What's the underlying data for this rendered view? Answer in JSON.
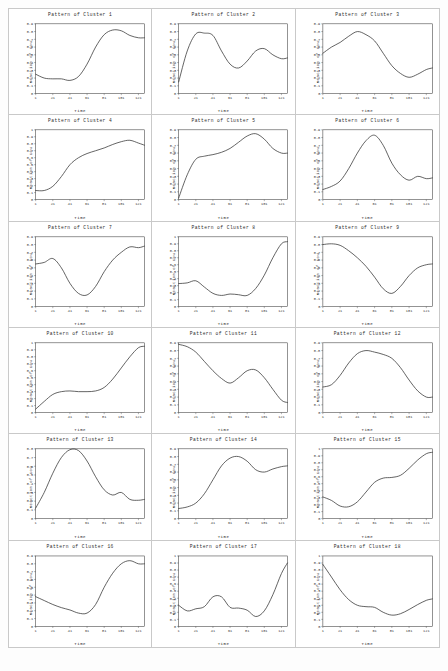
{
  "figure": {
    "caption": "",
    "columns": 3,
    "rows": 6
  },
  "chart_data": [
    {
      "type": "line",
      "title": "Pattern of Cluster 1",
      "xlabel": "Time",
      "ylabel": "Reaction of Cow",
      "xticks": [
        1,
        21,
        41,
        61,
        81,
        101,
        121
      ],
      "yticks": [
        0,
        0.1,
        0.2,
        0.3,
        0.4,
        0.5,
        0.6,
        0.7,
        0.8,
        0.9
      ],
      "xlim": [
        1,
        128
      ],
      "ylim": [
        0,
        0.9
      ],
      "grid": false,
      "legend": "none",
      "x": [
        1,
        11,
        21,
        31,
        41,
        51,
        61,
        71,
        81,
        91,
        101,
        111,
        121,
        128
      ],
      "values": [
        0.25,
        0.2,
        0.19,
        0.19,
        0.17,
        0.22,
        0.38,
        0.6,
        0.76,
        0.82,
        0.81,
        0.75,
        0.72,
        0.72
      ]
    },
    {
      "type": "line",
      "title": "Pattern of Cluster 2",
      "xlabel": "Time",
      "ylabel": "Reaction of Cow",
      "xticks": [
        1,
        21,
        41,
        61,
        81,
        101,
        121
      ],
      "yticks": [
        0,
        0.1,
        0.2,
        0.3,
        0.4,
        0.5,
        0.6,
        0.7,
        0.8,
        0.9
      ],
      "xlim": [
        1,
        128
      ],
      "ylim": [
        0,
        0.9
      ],
      "grid": false,
      "legend": "none",
      "x": [
        1,
        11,
        21,
        31,
        41,
        51,
        61,
        71,
        81,
        91,
        101,
        111,
        121,
        128
      ],
      "values": [
        0.15,
        0.55,
        0.77,
        0.78,
        0.75,
        0.55,
        0.38,
        0.33,
        0.42,
        0.55,
        0.58,
        0.5,
        0.45,
        0.46
      ]
    },
    {
      "type": "line",
      "title": "Pattern of Cluster 3",
      "xlabel": "Time",
      "ylabel": "Reaction of Cow",
      "xticks": [
        1,
        21,
        41,
        61,
        81,
        101,
        121
      ],
      "yticks": [
        0,
        0.1,
        0.2,
        0.3,
        0.4,
        0.5,
        0.6,
        0.7,
        0.8,
        0.9
      ],
      "xlim": [
        1,
        128
      ],
      "ylim": [
        0,
        0.9
      ],
      "grid": false,
      "legend": "none",
      "x": [
        1,
        11,
        21,
        31,
        41,
        51,
        61,
        71,
        81,
        91,
        101,
        111,
        121,
        128
      ],
      "values": [
        0.52,
        0.6,
        0.66,
        0.74,
        0.8,
        0.76,
        0.68,
        0.52,
        0.36,
        0.26,
        0.21,
        0.25,
        0.31,
        0.33
      ]
    },
    {
      "type": "line",
      "title": "Pattern of Cluster 4",
      "xlabel": "Time",
      "ylabel": "Reaction of Cow",
      "xticks": [
        1,
        21,
        41,
        61,
        81,
        101,
        121
      ],
      "yticks": [
        0,
        0.1,
        0.2,
        0.3,
        0.4,
        0.5,
        0.6,
        0.7,
        0.8,
        0.9,
        1
      ],
      "xlim": [
        1,
        128
      ],
      "ylim": [
        0,
        1
      ],
      "grid": false,
      "legend": "none",
      "x": [
        1,
        11,
        21,
        31,
        41,
        51,
        61,
        71,
        81,
        91,
        101,
        111,
        121,
        128
      ],
      "values": [
        0.13,
        0.13,
        0.19,
        0.33,
        0.5,
        0.6,
        0.66,
        0.7,
        0.74,
        0.79,
        0.83,
        0.85,
        0.81,
        0.78
      ]
    },
    {
      "type": "line",
      "title": "Pattern of Cluster 5",
      "xlabel": "Time",
      "ylabel": "Reaction of Cow",
      "xticks": [
        1,
        21,
        41,
        61,
        81,
        101,
        121
      ],
      "yticks": [
        0,
        0.1,
        0.2,
        0.3,
        0.4,
        0.5,
        0.6,
        0.7,
        0.8,
        0.9
      ],
      "xlim": [
        1,
        128
      ],
      "ylim": [
        0,
        0.9
      ],
      "grid": false,
      "legend": "none",
      "x": [
        1,
        11,
        21,
        31,
        41,
        51,
        61,
        71,
        81,
        91,
        101,
        111,
        121,
        128
      ],
      "values": [
        0.02,
        0.32,
        0.52,
        0.56,
        0.58,
        0.61,
        0.66,
        0.74,
        0.82,
        0.85,
        0.78,
        0.66,
        0.6,
        0.6
      ]
    },
    {
      "type": "line",
      "title": "Pattern of Cluster 6",
      "xlabel": "Time",
      "ylabel": "Reaction of Cow",
      "xticks": [
        1,
        21,
        41,
        61,
        81,
        101,
        121
      ],
      "yticks": [
        0,
        0.1,
        0.2,
        0.3,
        0.4,
        0.5,
        0.6,
        0.7,
        0.8,
        0.9
      ],
      "xlim": [
        1,
        128
      ],
      "ylim": [
        0,
        0.9
      ],
      "grid": false,
      "legend": "none",
      "x": [
        1,
        11,
        21,
        31,
        41,
        51,
        61,
        71,
        81,
        91,
        101,
        111,
        121,
        128
      ],
      "values": [
        0.13,
        0.17,
        0.24,
        0.4,
        0.6,
        0.76,
        0.83,
        0.7,
        0.47,
        0.32,
        0.25,
        0.3,
        0.27,
        0.28
      ]
    },
    {
      "type": "line",
      "title": "Pattern of Cluster 7",
      "xlabel": "Time",
      "ylabel": "Reaction of Cow",
      "xticks": [
        1,
        21,
        41,
        61,
        81,
        101,
        121
      ],
      "yticks": [
        0,
        0.1,
        0.2,
        0.3,
        0.4,
        0.5,
        0.6,
        0.7,
        0.8,
        0.9
      ],
      "xlim": [
        1,
        128
      ],
      "ylim": [
        0,
        0.9
      ],
      "grid": false,
      "legend": "none",
      "x": [
        1,
        11,
        21,
        31,
        41,
        51,
        61,
        71,
        81,
        91,
        101,
        111,
        121,
        128
      ],
      "values": [
        0.55,
        0.57,
        0.62,
        0.5,
        0.3,
        0.17,
        0.15,
        0.26,
        0.45,
        0.6,
        0.7,
        0.77,
        0.76,
        0.78
      ]
    },
    {
      "type": "line",
      "title": "Pattern of Cluster 8",
      "xlabel": "Time",
      "ylabel": "Reaction of Cow",
      "xticks": [
        1,
        21,
        41,
        61,
        81,
        101,
        121
      ],
      "yticks": [
        0,
        0.1,
        0.2,
        0.3,
        0.4,
        0.5,
        0.6,
        0.7,
        0.8,
        0.9,
        1
      ],
      "xlim": [
        1,
        128
      ],
      "ylim": [
        0,
        1
      ],
      "grid": false,
      "legend": "none",
      "x": [
        1,
        11,
        21,
        31,
        41,
        51,
        61,
        71,
        81,
        91,
        101,
        111,
        121,
        128
      ],
      "values": [
        0.33,
        0.34,
        0.37,
        0.28,
        0.19,
        0.16,
        0.18,
        0.17,
        0.16,
        0.26,
        0.45,
        0.7,
        0.9,
        0.93
      ]
    },
    {
      "type": "line",
      "title": "Pattern of Cluster 9",
      "xlabel": "Time",
      "ylabel": "Reaction of Cow",
      "xticks": [
        1,
        21,
        41,
        61,
        81,
        101,
        121
      ],
      "yticks": [
        0,
        0.1,
        0.2,
        0.3,
        0.4,
        0.5,
        0.6,
        0.7,
        0.8,
        0.9
      ],
      "xlim": [
        1,
        128
      ],
      "ylim": [
        0,
        0.9
      ],
      "grid": false,
      "legend": "none",
      "x": [
        1,
        11,
        21,
        31,
        41,
        51,
        61,
        71,
        81,
        91,
        101,
        111,
        121,
        128
      ],
      "values": [
        0.8,
        0.81,
        0.79,
        0.72,
        0.63,
        0.52,
        0.38,
        0.23,
        0.17,
        0.26,
        0.4,
        0.5,
        0.54,
        0.55
      ]
    },
    {
      "type": "line",
      "title": "Pattern of Cluster 10",
      "xlabel": "Time",
      "ylabel": "Reaction of Cow",
      "xticks": [
        1,
        21,
        41,
        61,
        81,
        101,
        121
      ],
      "yticks": [
        0,
        0.1,
        0.2,
        0.3,
        0.4,
        0.5,
        0.6,
        0.7,
        0.8,
        0.9,
        1
      ],
      "xlim": [
        1,
        128
      ],
      "ylim": [
        0,
        1
      ],
      "grid": false,
      "legend": "none",
      "x": [
        1,
        11,
        21,
        31,
        41,
        51,
        61,
        71,
        81,
        91,
        101,
        111,
        121,
        128
      ],
      "values": [
        0.05,
        0.16,
        0.26,
        0.3,
        0.31,
        0.3,
        0.3,
        0.31,
        0.36,
        0.48,
        0.64,
        0.8,
        0.93,
        0.95
      ]
    },
    {
      "type": "line",
      "title": "Pattern of Cluster 11",
      "xlabel": "Time",
      "ylabel": "Reaction of Cow",
      "xticks": [
        1,
        21,
        41,
        61,
        81,
        101,
        121
      ],
      "yticks": [
        0,
        0.1,
        0.2,
        0.3,
        0.4,
        0.5,
        0.6,
        0.7,
        0.8,
        0.9
      ],
      "xlim": [
        1,
        128
      ],
      "ylim": [
        0,
        0.9
      ],
      "grid": false,
      "legend": "none",
      "x": [
        1,
        11,
        21,
        31,
        41,
        51,
        61,
        71,
        81,
        91,
        101,
        111,
        121,
        128
      ],
      "values": [
        0.88,
        0.85,
        0.78,
        0.66,
        0.54,
        0.44,
        0.38,
        0.45,
        0.54,
        0.55,
        0.45,
        0.3,
        0.16,
        0.13
      ]
    },
    {
      "type": "line",
      "title": "Pattern of Cluster 12",
      "xlabel": "Time",
      "ylabel": "Reaction of Cow",
      "xticks": [
        1,
        21,
        41,
        61,
        81,
        101,
        121
      ],
      "yticks": [
        0,
        0.1,
        0.2,
        0.3,
        0.4,
        0.5,
        0.6,
        0.7,
        0.8,
        0.9
      ],
      "xlim": [
        1,
        128
      ],
      "ylim": [
        0,
        0.9
      ],
      "grid": false,
      "legend": "none",
      "x": [
        1,
        11,
        21,
        31,
        41,
        51,
        61,
        71,
        81,
        91,
        101,
        111,
        121,
        128
      ],
      "values": [
        0.33,
        0.36,
        0.48,
        0.64,
        0.76,
        0.8,
        0.78,
        0.75,
        0.7,
        0.58,
        0.42,
        0.28,
        0.2,
        0.2
      ]
    },
    {
      "type": "line",
      "title": "Pattern of Cluster 13",
      "xlabel": "Time",
      "ylabel": "Reaction of Cow",
      "xticks": [
        1,
        21,
        41,
        61,
        81,
        101,
        121
      ],
      "yticks": [
        0,
        0.1,
        0.2,
        0.3,
        0.4,
        0.5,
        0.6,
        0.7,
        0.8
      ],
      "xlim": [
        1,
        128
      ],
      "ylim": [
        0,
        0.8
      ],
      "grid": false,
      "legend": "none",
      "x": [
        1,
        11,
        21,
        31,
        41,
        51,
        61,
        71,
        81,
        91,
        101,
        111,
        121,
        128
      ],
      "values": [
        0.12,
        0.3,
        0.52,
        0.7,
        0.79,
        0.78,
        0.66,
        0.48,
        0.33,
        0.27,
        0.3,
        0.22,
        0.21,
        0.22
      ]
    },
    {
      "type": "line",
      "title": "Pattern of Cluster 14",
      "xlabel": "Time",
      "ylabel": "Reaction of Cow",
      "xticks": [
        1,
        21,
        41,
        61,
        81,
        101,
        121
      ],
      "yticks": [
        0,
        0.1,
        0.2,
        0.3,
        0.4,
        0.5,
        0.6,
        0.7,
        0.8,
        0.9
      ],
      "xlim": [
        1,
        128
      ],
      "ylim": [
        0,
        0.9
      ],
      "grid": false,
      "legend": "none",
      "x": [
        1,
        11,
        21,
        31,
        41,
        51,
        61,
        71,
        81,
        91,
        101,
        111,
        121,
        128
      ],
      "values": [
        0.13,
        0.15,
        0.2,
        0.32,
        0.5,
        0.68,
        0.78,
        0.8,
        0.74,
        0.63,
        0.6,
        0.64,
        0.67,
        0.68
      ]
    },
    {
      "type": "line",
      "title": "Pattern of Cluster 15",
      "xlabel": "Time",
      "ylabel": "Reaction of Cow",
      "xticks": [
        1,
        21,
        41,
        61,
        81,
        101,
        121
      ],
      "yticks": [
        0,
        0.1,
        0.2,
        0.3,
        0.4,
        0.5,
        0.6,
        0.7,
        0.8,
        0.9,
        1
      ],
      "xlim": [
        1,
        128
      ],
      "ylim": [
        0,
        1
      ],
      "grid": false,
      "legend": "none",
      "x": [
        1,
        11,
        21,
        31,
        41,
        51,
        61,
        71,
        81,
        91,
        101,
        111,
        121,
        128
      ],
      "values": [
        0.31,
        0.26,
        0.18,
        0.17,
        0.24,
        0.38,
        0.52,
        0.58,
        0.59,
        0.62,
        0.72,
        0.84,
        0.93,
        0.95
      ]
    },
    {
      "type": "line",
      "title": "Pattern of Cluster 16",
      "xlabel": "Time",
      "ylabel": "Reaction of Cow",
      "xticks": [
        1,
        21,
        41,
        61,
        81,
        101,
        121
      ],
      "yticks": [
        0,
        0.1,
        0.2,
        0.3,
        0.4,
        0.5,
        0.6,
        0.7,
        0.8,
        0.9
      ],
      "xlim": [
        1,
        128
      ],
      "ylim": [
        0,
        0.9
      ],
      "grid": false,
      "legend": "none",
      "x": [
        1,
        11,
        21,
        31,
        41,
        51,
        61,
        71,
        81,
        91,
        101,
        111,
        121,
        128
      ],
      "values": [
        0.38,
        0.33,
        0.28,
        0.24,
        0.21,
        0.17,
        0.17,
        0.28,
        0.5,
        0.68,
        0.8,
        0.84,
        0.8,
        0.8
      ]
    },
    {
      "type": "line",
      "title": "Pattern of Cluster 17",
      "xlabel": "Time",
      "ylabel": "Reaction of Cow",
      "xticks": [
        1,
        21,
        41,
        61,
        81,
        101,
        121
      ],
      "yticks": [
        0,
        0.1,
        0.2,
        0.3,
        0.4,
        0.5,
        0.6,
        0.7,
        0.8,
        0.9,
        1
      ],
      "xlim": [
        1,
        128
      ],
      "ylim": [
        0,
        1
      ],
      "grid": false,
      "legend": "none",
      "x": [
        1,
        11,
        21,
        31,
        41,
        51,
        61,
        71,
        81,
        91,
        101,
        111,
        121,
        128
      ],
      "values": [
        0.3,
        0.22,
        0.25,
        0.28,
        0.42,
        0.42,
        0.27,
        0.26,
        0.23,
        0.14,
        0.22,
        0.45,
        0.75,
        0.9
      ]
    },
    {
      "type": "line",
      "title": "Pattern of Cluster 18",
      "xlabel": "Time",
      "ylabel": "Reaction of Cow",
      "xticks": [
        1,
        21,
        41,
        61,
        81,
        101,
        121
      ],
      "yticks": [
        0,
        0.1,
        0.2,
        0.3,
        0.4,
        0.5,
        0.6,
        0.7,
        0.8,
        0.9,
        1
      ],
      "xlim": [
        1,
        128
      ],
      "ylim": [
        0,
        1
      ],
      "grid": false,
      "legend": "none",
      "x": [
        1,
        11,
        21,
        31,
        41,
        51,
        61,
        71,
        81,
        91,
        101,
        111,
        121,
        128
      ],
      "values": [
        0.88,
        0.7,
        0.52,
        0.38,
        0.3,
        0.28,
        0.27,
        0.2,
        0.16,
        0.18,
        0.24,
        0.31,
        0.37,
        0.39
      ]
    }
  ]
}
